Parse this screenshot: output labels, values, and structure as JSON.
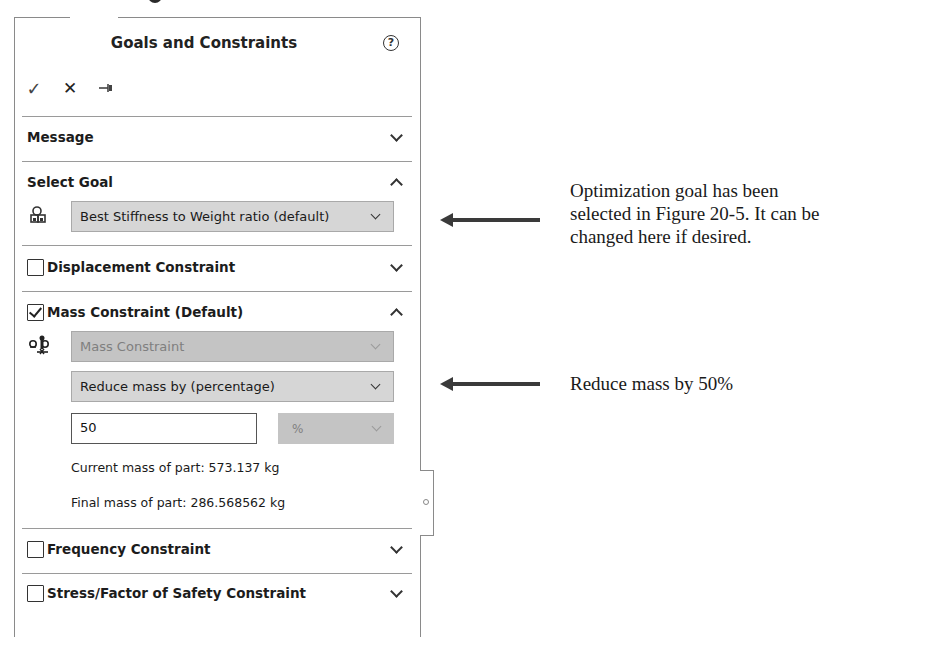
{
  "panel": {
    "title": "Goals and Constraints",
    "help_icon": "?",
    "toolbar": {
      "ok_icon": "✓",
      "cancel_icon": "✕",
      "pin_icon": "⇥"
    }
  },
  "sections": {
    "message": {
      "label": "Message",
      "expanded": false
    },
    "select_goal": {
      "label": "Select Goal",
      "expanded": true,
      "goal_dropdown": {
        "value": "Best Stiffness to Weight ratio (default)"
      }
    },
    "displacement": {
      "label": "Displacement Constraint",
      "checked": false,
      "expanded": false
    },
    "mass": {
      "label": "Mass Constraint (Default)",
      "checked": true,
      "expanded": true,
      "type_dropdown": {
        "value": "Mass Constraint",
        "disabled": true
      },
      "mode_dropdown": {
        "value": "Reduce mass by (percentage)"
      },
      "value_input": "50",
      "unit_dropdown": {
        "value": "%",
        "disabled": true
      },
      "current_mass": "Current mass of part: 573.137 kg",
      "final_mass": "Final mass of part: 286.568562 kg"
    },
    "frequency": {
      "label": "Frequency Constraint",
      "checked": false,
      "expanded": false
    },
    "stress": {
      "label": "Stress/Factor of Safety Constraint",
      "checked": false,
      "expanded": false
    }
  },
  "annotations": {
    "goal_note": [
      "Optimization goal has been",
      "selected in Figure 20-5. It can be",
      "changed here if desired."
    ],
    "mass_note": "Reduce mass by 50%"
  },
  "colors": {
    "dropdown_bg": "#d6d6d6",
    "disabled_bg": "#c4c4c4",
    "border": "#8a8a8a",
    "text": "#1e1e1e"
  }
}
